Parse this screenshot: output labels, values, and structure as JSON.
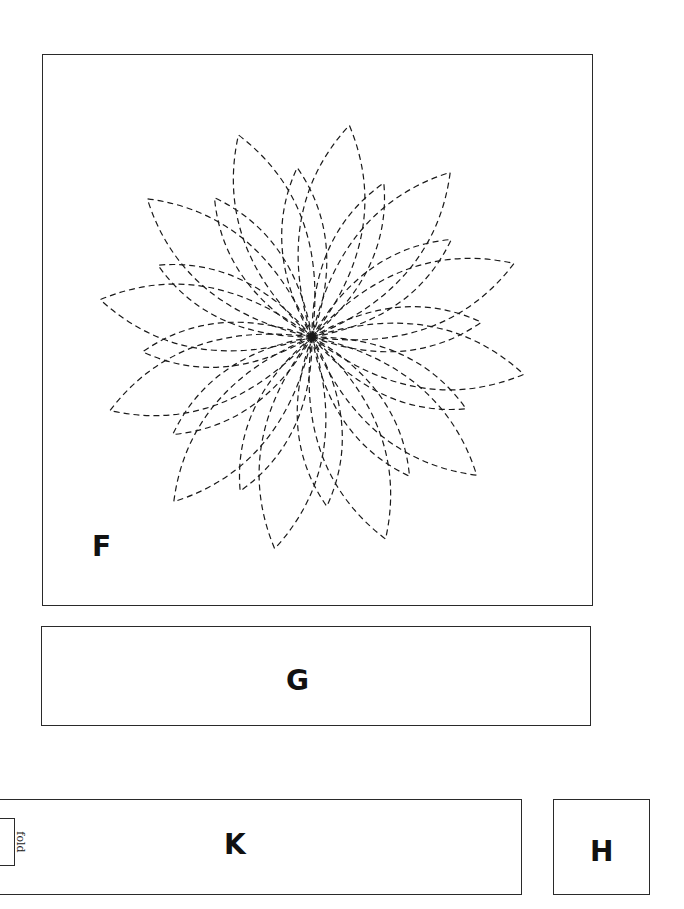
{
  "panels": {
    "F": {
      "label": "F",
      "content": "dashed-outline flower with overlapping pointed petals"
    },
    "G": {
      "label": "G"
    },
    "K": {
      "label": "K",
      "fold_label": "fold"
    },
    "H": {
      "label": "H"
    }
  },
  "flower": {
    "center": [
      312,
      337
    ],
    "outer_petals": 12,
    "inner_petals": 12,
    "stroke_color": "#1a1a1a",
    "dash": "6,4"
  }
}
